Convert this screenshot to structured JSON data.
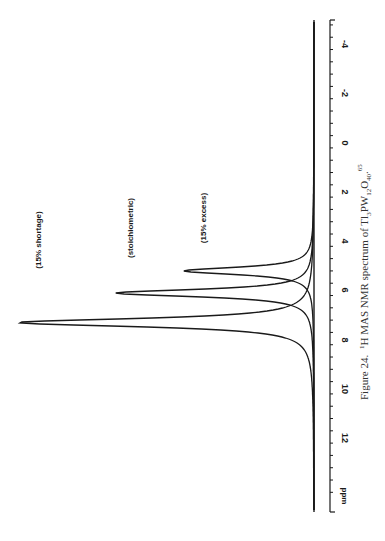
{
  "figure": {
    "caption_prefix": "Figure 24.",
    "caption_sup_1": "1",
    "caption_main": "H MAS NMR spectrum of Tl",
    "caption_sub_3": "3",
    "caption_pw": "PW",
    "caption_sub_12": "12",
    "caption_o": "O",
    "caption_sub_40": "40",
    "caption_end": ".",
    "caption_sup_ref": "65"
  },
  "axis": {
    "unit_label": "ppm",
    "tick_labels": [
      "-4",
      "-2",
      "0",
      "2",
      "4",
      "6",
      "8",
      "10",
      "12"
    ]
  },
  "series_labels": {
    "shortage": "(15% shortage)",
    "stoichiometric": "(stoichiometric)",
    "excess": "(15% excess)"
  },
  "chart_data": {
    "type": "line",
    "title": "1H MAS NMR spectrum of Tl3PW12O40",
    "xlabel": "ppm",
    "ylabel": "",
    "orientation": "rotated 90° (ppm axis vertical, intensity horizontal to the left)",
    "xlim": [
      13.5,
      -5
    ],
    "x_ticks": [
      -4,
      -2,
      0,
      2,
      4,
      6,
      8,
      10,
      12
    ],
    "grid": false,
    "legend": "inline labels above each peak",
    "series": [
      {
        "name": "(15% shortage)",
        "peak_ppm": 7.3,
        "relative_height": 1.0,
        "approx_fwhm_ppm": 0.9
      },
      {
        "name": "(stoichiometric)",
        "peak_ppm": 6.1,
        "relative_height": 0.67,
        "approx_fwhm_ppm": 0.8
      },
      {
        "name": "(15% excess)",
        "peak_ppm": 5.2,
        "relative_height": 0.44,
        "approx_fwhm_ppm": 0.8
      }
    ],
    "annotations": [
      "(15% shortage)",
      "(stoichiometric)",
      "(15% excess)"
    ]
  }
}
